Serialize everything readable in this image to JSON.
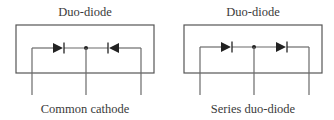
{
  "panels": [
    {
      "title": "Duo-diode",
      "caption": "Common cathode",
      "configuration": "common-cathode",
      "diodes": [
        {
          "position": "left",
          "direction": "right"
        },
        {
          "position": "right",
          "direction": "left"
        }
      ]
    },
    {
      "title": "Duo-diode",
      "caption": "Series duo-diode",
      "configuration": "series",
      "diodes": [
        {
          "position": "left",
          "direction": "right"
        },
        {
          "position": "right",
          "direction": "right"
        }
      ]
    }
  ],
  "colors": {
    "line": "#6a6a6a",
    "diode": "#222222",
    "text": "#3a3a3a"
  }
}
